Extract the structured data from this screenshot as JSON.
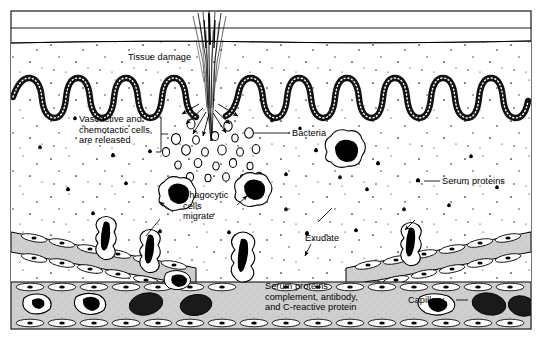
{
  "figure": {
    "type": "biological-cross-section-diagram",
    "background_color": "#ffffff",
    "frame_color": "#000000",
    "tissue_fill": "#ffffff",
    "vessel_fill": "#c9c9c9",
    "cell_nucleus_color": "#000000"
  },
  "labels": {
    "tissue_damage": "Tissue damage",
    "vasoactive": "Vasoactive and\nchemotactic cells\nare released",
    "bacteria": "Bacteria",
    "serum_proteins": "Serum proteins",
    "phagocytic": "Phagocytic\ncells\nmigrate",
    "exudate": "Exudate",
    "serum_bottom": "Serum proteins\ncomplement, antibody,\nand C-reactive protein",
    "capillary": "Capillary"
  },
  "elements": {
    "splinter": "splinter-thorn-penetrating-skin",
    "epidermis": "wavy-stippled-epidermal-layer",
    "dermis": "dermis-tissue-region",
    "bacteria_glyph": "open-circle",
    "serum_protein_glyph": "small-clover-cross",
    "phagocyte_glyph": "amoeboid-cell-with-dark-nucleus",
    "capillary_glyph": "gray-vessel-with-endothelial-cells",
    "blood_cell_glyph": "erythrocyte-and-leukocyte",
    "diapedesis": "cells-squeezing-through-vessel-wall"
  }
}
